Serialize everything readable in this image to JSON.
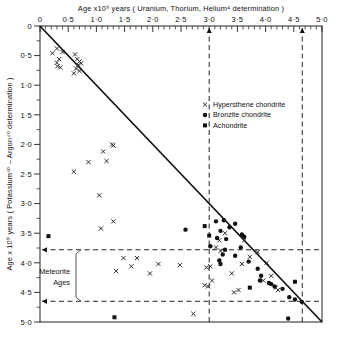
{
  "chart_data": {
    "type": "scatter",
    "title": "Age x10⁹ years ( Uranium, Thorium, Helium⁴ determination )",
    "xlabel": "Age x10⁹ years ( Uranium, Thorium, Helium⁴ determination )",
    "ylabel": "Age x 10⁹ years ( Potassium⁴⁰ – Argon⁴⁰ determination )",
    "xlim": [
      0,
      5
    ],
    "ylim": [
      0,
      5
    ],
    "y_inverted": true,
    "x_axis_position": "top",
    "grid": false,
    "x_major_step": 0.5,
    "x_minor_step": 0.1,
    "y_major_step": 0.5,
    "y_minor_step": 0.25,
    "x_ticklabels": [
      "0",
      "0·5",
      "1·0",
      "1·5",
      "2·0",
      "2·5",
      "3·0",
      "3·5",
      "4·0",
      "4·5",
      "5·0"
    ],
    "y_ticklabels": [
      "0",
      "0·5",
      "1·0",
      "1·5",
      "2·0",
      "2·5",
      "3·0",
      "3·5",
      "4·0",
      "4·5",
      "5·0"
    ],
    "reference_line": {
      "label": "1:1 concordia line",
      "from": [
        0,
        0
      ],
      "to": [
        5,
        5
      ]
    },
    "vertical_markers": [
      3.0,
      4.65
    ],
    "horizontal_markers": [
      3.78,
      4.65
    ],
    "annotation": {
      "line1": "Meteorite",
      "line2": "Ages",
      "from_y": 3.78,
      "to_y": 4.65
    },
    "legend_position": "top-right",
    "series": [
      {
        "name": "Hypersthene chondrite",
        "marker": "x",
        "color": "#222222",
        "points": [
          [
            0.3,
            0.38
          ],
          [
            0.22,
            0.46
          ],
          [
            0.4,
            0.44
          ],
          [
            0.34,
            0.56
          ],
          [
            0.3,
            0.62
          ],
          [
            0.31,
            0.68
          ],
          [
            0.36,
            0.7
          ],
          [
            0.62,
            0.48
          ],
          [
            0.66,
            0.56
          ],
          [
            0.7,
            0.6
          ],
          [
            0.68,
            0.66
          ],
          [
            0.73,
            0.63
          ],
          [
            0.64,
            0.72
          ],
          [
            0.7,
            0.76
          ],
          [
            0.6,
            0.8
          ],
          [
            1.12,
            2.12
          ],
          [
            1.28,
            2.0
          ],
          [
            1.3,
            2.02
          ],
          [
            1.18,
            2.28
          ],
          [
            0.86,
            2.3
          ],
          [
            0.6,
            2.46
          ],
          [
            1.05,
            2.86
          ],
          [
            1.3,
            3.3
          ],
          [
            1.08,
            3.42
          ],
          [
            1.48,
            3.92
          ],
          [
            1.72,
            3.92
          ],
          [
            1.35,
            4.14
          ],
          [
            1.62,
            4.06
          ],
          [
            1.95,
            4.18
          ],
          [
            2.1,
            4.02
          ],
          [
            2.48,
            4.04
          ],
          [
            2.95,
            4.08
          ],
          [
            3.02,
            4.06
          ],
          [
            2.92,
            4.38
          ],
          [
            2.98,
            4.4
          ],
          [
            3.4,
            4.18
          ],
          [
            3.52,
            4.46
          ],
          [
            3.44,
            4.5
          ],
          [
            3.62,
            3.62
          ],
          [
            3.72,
            3.9
          ],
          [
            3.86,
            3.82
          ],
          [
            4.02,
            4.0
          ],
          [
            4.1,
            4.22
          ],
          [
            3.96,
            4.3
          ],
          [
            4.18,
            4.42
          ],
          [
            4.22,
            4.46
          ],
          [
            3.28,
            3.5
          ],
          [
            3.18,
            3.62
          ],
          [
            3.12,
            3.74
          ],
          [
            3.2,
            3.8
          ],
          [
            3.05,
            4.3
          ],
          [
            2.72,
            4.86
          ],
          [
            3.58,
            4.02
          ]
        ]
      },
      {
        "name": "Bronzite chondrite",
        "marker": "circle",
        "color": "#111111",
        "points": [
          [
            3.12,
            3.3
          ],
          [
            3.26,
            3.28
          ],
          [
            3.2,
            3.46
          ],
          [
            3.14,
            3.58
          ],
          [
            3.3,
            3.6
          ],
          [
            3.02,
            3.72
          ],
          [
            3.28,
            3.78
          ],
          [
            3.24,
            3.86
          ],
          [
            3.18,
            3.96
          ],
          [
            3.2,
            4.02
          ],
          [
            3.46,
            3.88
          ],
          [
            3.56,
            3.74
          ],
          [
            3.62,
            3.56
          ],
          [
            3.7,
            3.98
          ],
          [
            3.86,
            4.1
          ],
          [
            3.92,
            4.22
          ],
          [
            3.9,
            4.3
          ],
          [
            4.06,
            4.34
          ],
          [
            4.1,
            4.36
          ],
          [
            4.16,
            4.4
          ],
          [
            4.3,
            4.44
          ],
          [
            4.42,
            4.58
          ],
          [
            4.52,
            4.62
          ],
          [
            4.64,
            4.66
          ],
          [
            4.4,
            4.94
          ],
          [
            2.58,
            3.44
          ],
          [
            3.46,
            3.34
          ],
          [
            3.36,
            3.4
          ],
          [
            3.58,
            3.52
          ]
        ]
      },
      {
        "name": "Achondrite",
        "marker": "square",
        "color": "#111111",
        "points": [
          [
            0.15,
            3.55
          ],
          [
            2.92,
            3.38
          ],
          [
            3.0,
            3.54
          ],
          [
            4.52,
            4.32
          ],
          [
            1.32,
            4.92
          ],
          [
            3.72,
            4.42
          ]
        ]
      }
    ]
  },
  "legend": {
    "items": [
      {
        "label": "Hypersthene chondrite",
        "marker": "x"
      },
      {
        "label": "Bronzite chondrite",
        "marker": "circle"
      },
      {
        "label": "Achondrite",
        "marker": "square"
      }
    ]
  }
}
